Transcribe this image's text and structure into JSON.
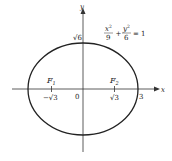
{
  "diagram": {
    "type": "ellipse",
    "equation": {
      "x_num": "x",
      "x_exp": "2",
      "x_den": "9",
      "plus": "+",
      "y_num": "y",
      "y_exp": "2",
      "y_den": "6",
      "equals": "= 1"
    },
    "axes": {
      "x_label": "x",
      "y_label": "y"
    },
    "labels": {
      "origin": "0",
      "y_intercept": "√6",
      "x_intercept": "3",
      "focus1_name": "F",
      "focus1_sub": "1",
      "focus2_name": "F",
      "focus2_sub": "2",
      "focus1_x": "−√3",
      "focus2_x": "√3"
    },
    "params": {
      "a": 3,
      "b": 2.449,
      "c": 1.732
    },
    "colors": {
      "stroke": "#222222",
      "background": "#ffffff"
    }
  }
}
